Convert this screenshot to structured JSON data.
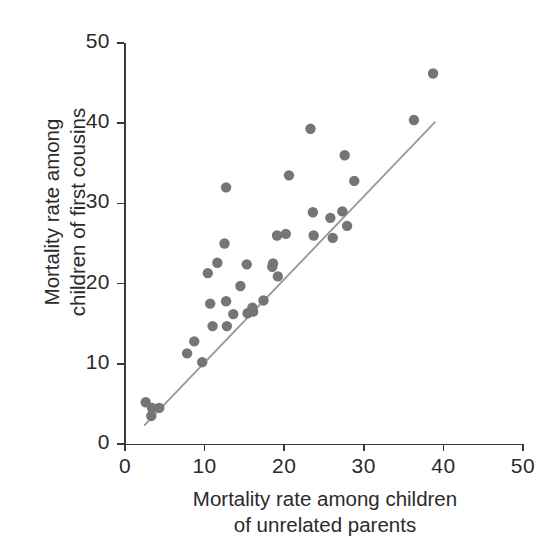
{
  "chart_data": {
    "type": "scatter",
    "title": "",
    "xlabel": "Mortality rate among children of unrelated parents",
    "ylabel": "Mortality rate among children of first cousins",
    "xlabel_lines": [
      "Mortality rate among children",
      "of unrelated parents"
    ],
    "ylabel_lines": [
      "Mortality rate among",
      "children of first cousins"
    ],
    "xlim": [
      0,
      50
    ],
    "ylim": [
      0,
      50
    ],
    "xticks": [
      0,
      10,
      20,
      30,
      40,
      50
    ],
    "yticks": [
      0,
      10,
      20,
      30,
      40,
      50
    ],
    "xtick_labels": [
      "0",
      "10",
      "20",
      "30",
      "40",
      "50"
    ],
    "ytick_labels": [
      "0",
      "10",
      "20",
      "30",
      "40",
      "50"
    ],
    "grid": false,
    "legend": null,
    "marker_color": "#757575",
    "marker_radius": 5.2,
    "axis_color": "#3a3a3a",
    "trend_line": {
      "color": "#9a9a9a",
      "x": [
        2.4,
        39.0
      ],
      "y": [
        2.3,
        40.2
      ]
    },
    "points": [
      {
        "x": 2.6,
        "y": 5.2
      },
      {
        "x": 3.4,
        "y": 4.5
      },
      {
        "x": 3.3,
        "y": 3.5
      },
      {
        "x": 4.3,
        "y": 4.5
      },
      {
        "x": 7.8,
        "y": 11.3
      },
      {
        "x": 8.7,
        "y": 12.8
      },
      {
        "x": 9.7,
        "y": 10.2
      },
      {
        "x": 10.4,
        "y": 21.3
      },
      {
        "x": 10.7,
        "y": 17.5
      },
      {
        "x": 11.0,
        "y": 14.7
      },
      {
        "x": 11.6,
        "y": 22.6
      },
      {
        "x": 12.7,
        "y": 32.0
      },
      {
        "x": 12.5,
        "y": 25.0
      },
      {
        "x": 12.7,
        "y": 17.8
      },
      {
        "x": 12.8,
        "y": 14.7
      },
      {
        "x": 13.6,
        "y": 16.2
      },
      {
        "x": 14.5,
        "y": 19.7
      },
      {
        "x": 15.3,
        "y": 22.4
      },
      {
        "x": 15.4,
        "y": 16.3
      },
      {
        "x": 16.0,
        "y": 17.0
      },
      {
        "x": 16.1,
        "y": 16.5
      },
      {
        "x": 17.4,
        "y": 17.9
      },
      {
        "x": 18.5,
        "y": 22.1
      },
      {
        "x": 18.6,
        "y": 22.5
      },
      {
        "x": 19.1,
        "y": 26.0
      },
      {
        "x": 19.2,
        "y": 20.9
      },
      {
        "x": 20.2,
        "y": 26.2
      },
      {
        "x": 20.6,
        "y": 33.5
      },
      {
        "x": 23.3,
        "y": 39.3
      },
      {
        "x": 23.6,
        "y": 28.9
      },
      {
        "x": 23.7,
        "y": 26.0
      },
      {
        "x": 25.8,
        "y": 28.2
      },
      {
        "x": 26.1,
        "y": 25.7
      },
      {
        "x": 27.3,
        "y": 29.0
      },
      {
        "x": 27.6,
        "y": 36.0
      },
      {
        "x": 27.9,
        "y": 27.2
      },
      {
        "x": 28.8,
        "y": 32.8
      },
      {
        "x": 36.3,
        "y": 40.4
      },
      {
        "x": 38.7,
        "y": 46.2
      }
    ]
  }
}
